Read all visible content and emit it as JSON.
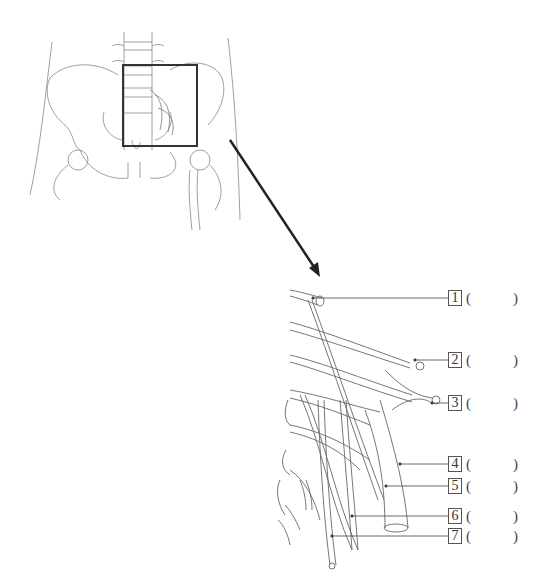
{
  "diagram": {
    "overview": {
      "description": "Anterior view of lumbar spine, pelvis and proximal femurs with a square highlighting the left lumbar plexus region",
      "highlight_box": {
        "x": 123,
        "y": 65,
        "w": 74,
        "h": 81
      }
    },
    "arrow": {
      "from": [
        232,
        143
      ],
      "to": [
        320,
        276
      ],
      "color": "#222222"
    },
    "detail": {
      "description": "Magnified lumbar plexus branches with numbered callouts"
    },
    "labels": [
      {
        "number": "1",
        "answer": "",
        "open": "(",
        "close": ")"
      },
      {
        "number": "2",
        "answer": "",
        "open": "(",
        "close": ")"
      },
      {
        "number": "3",
        "answer": "",
        "open": "(",
        "close": ")"
      },
      {
        "number": "4",
        "answer": "",
        "open": "(",
        "close": ")"
      },
      {
        "number": "5",
        "answer": "",
        "open": "(",
        "close": ")"
      },
      {
        "number": "6",
        "answer": "",
        "open": "(",
        "close": ")"
      },
      {
        "number": "7",
        "answer": "",
        "open": "(",
        "close": ")"
      }
    ],
    "colors": {
      "line": "#555555",
      "arrow": "#222222",
      "box": "#333333",
      "background": "#ffffff"
    }
  }
}
